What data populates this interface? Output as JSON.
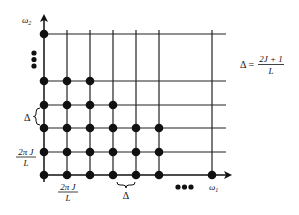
{
  "diagram": {
    "type": "lattice",
    "axes": {
      "x_label": "ω",
      "x_sub": "1",
      "y_label": "ω",
      "y_sub": "2"
    },
    "columns_x": [
      44,
      67,
      90,
      113,
      136,
      159,
      212
    ],
    "rows_y": [
      34,
      81,
      105,
      128,
      152,
      175
    ],
    "dots": [
      {
        "x": 44,
        "y": 34
      },
      {
        "x": 44,
        "y": 81
      },
      {
        "x": 67,
        "y": 81
      },
      {
        "x": 90,
        "y": 81
      },
      {
        "x": 44,
        "y": 105
      },
      {
        "x": 67,
        "y": 105
      },
      {
        "x": 90,
        "y": 105
      },
      {
        "x": 113,
        "y": 105
      },
      {
        "x": 44,
        "y": 128
      },
      {
        "x": 67,
        "y": 128
      },
      {
        "x": 90,
        "y": 128
      },
      {
        "x": 113,
        "y": 128
      },
      {
        "x": 136,
        "y": 128
      },
      {
        "x": 159,
        "y": 128
      },
      {
        "x": 44,
        "y": 152
      },
      {
        "x": 67,
        "y": 152
      },
      {
        "x": 90,
        "y": 152
      },
      {
        "x": 113,
        "y": 152
      },
      {
        "x": 136,
        "y": 152
      },
      {
        "x": 159,
        "y": 152
      },
      {
        "x": 44,
        "y": 175
      },
      {
        "x": 67,
        "y": 175
      },
      {
        "x": 90,
        "y": 175
      },
      {
        "x": 113,
        "y": 175
      },
      {
        "x": 136,
        "y": 175
      },
      {
        "x": 159,
        "y": 175
      },
      {
        "x": 212,
        "y": 175
      }
    ],
    "ellipsis_vertical": "•••",
    "ellipsis_horizontal": "•••",
    "spacing_label": {
      "symbol": "Δ"
    },
    "lattice_label": {
      "numerator": "2π J",
      "denominator": "L"
    },
    "formula": {
      "lhs": "Δ =",
      "numerator": "2J + 1",
      "denominator": "L"
    }
  }
}
